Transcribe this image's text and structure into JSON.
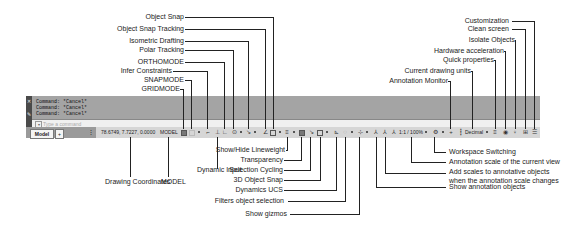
{
  "command_window": {
    "history": [
      "Command: *Cancel*",
      "Command: *Cancel*",
      "Command: *Cancel*"
    ],
    "placeholder": "Type a command",
    "close_icon": "close-icon",
    "settings_icon": "wrench-icon"
  },
  "layout_tabs": {
    "model": "Model",
    "add": "+"
  },
  "status_bar": {
    "coordinates": "78.6749, 7.7227, 0.0000",
    "space": "MODEL",
    "annotation_scale": "1:1 / 100%",
    "units": "Decimal"
  },
  "callouts_top_left": [
    {
      "label": "Object Snap"
    },
    {
      "label": "Object Snap Tracking"
    },
    {
      "label": "Isometric Drafting"
    },
    {
      "label": "Polar Tracking"
    },
    {
      "label": "ORTHOMODE"
    },
    {
      "label": "Infer Constraints"
    },
    {
      "label": "SNAPMODE"
    },
    {
      "label": "GRIDMODE"
    }
  ],
  "callouts_top_right": [
    {
      "label": "Customization"
    },
    {
      "label": "Clean screen"
    },
    {
      "label": "Isolate Objects"
    },
    {
      "label": "Hardware acceleration"
    },
    {
      "label": "Quick properties"
    },
    {
      "label": "Current drawing units"
    },
    {
      "label": "Annotation Monitor"
    }
  ],
  "callouts_bottom": [
    {
      "label": "Drawing Coordinates"
    },
    {
      "label": "MODEL"
    },
    {
      "label": "Dynamic Input"
    },
    {
      "label": "Show/Hide Lineweight"
    },
    {
      "label": "Transparency"
    },
    {
      "label": "Selection Cycling"
    },
    {
      "label": "3D Object Snap"
    },
    {
      "label": "Dynamics UCS"
    },
    {
      "label": "Filters object selection"
    },
    {
      "label": "Show gizmos"
    },
    {
      "label": "Workspace Switching"
    },
    {
      "label": "Annotation scale of the current view"
    },
    {
      "label": "Add scales to annotative objects"
    },
    {
      "label": "when the annotation scale changes"
    },
    {
      "label": "Show annotation objects"
    }
  ]
}
